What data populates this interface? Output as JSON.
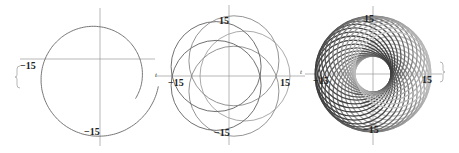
{
  "figure": {
    "panels": [
      {
        "id": "panel-1",
        "center": [
          100,
          59
        ],
        "axis_labels": {
          "x": "t"
        },
        "tick_labels": {
          "left": "−15",
          "bottom": "−15"
        },
        "curve": {
          "type": "single-loop",
          "circles": 1
        }
      },
      {
        "id": "panel-2",
        "center": [
          229,
          76
        ],
        "axis_labels": {
          "x": "t"
        },
        "tick_labels": {
          "top": "15",
          "right": "15",
          "left": "−15",
          "bottom": "−15"
        },
        "curve": {
          "type": "rotating-circles",
          "circles": 5
        }
      },
      {
        "id": "panel-3",
        "center": [
          373,
          74
        ],
        "axis_labels": {
          "x": "t"
        },
        "tick_labels": {
          "top": "15",
          "right": "15",
          "left": "−15",
          "bottom": "−15"
        },
        "curve": {
          "type": "rotating-circles",
          "circles": 30
        }
      }
    ],
    "colors": {
      "curve": "#555555",
      "axis": "#888888",
      "text": "#222222"
    }
  }
}
